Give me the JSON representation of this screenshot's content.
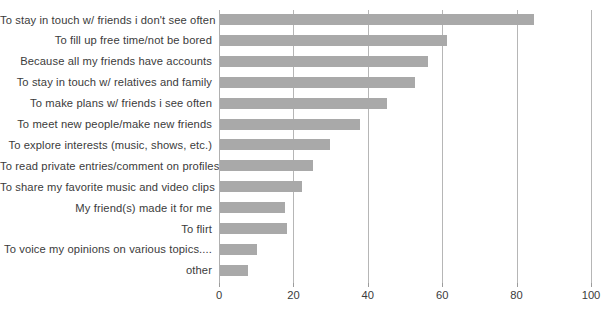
{
  "chart_data": {
    "type": "bar",
    "orientation": "horizontal",
    "title": "",
    "subtitle": "",
    "xlabel": "",
    "ylabel": "",
    "xlim": [
      0,
      100
    ],
    "xticks": [
      0,
      20,
      40,
      60,
      80,
      100
    ],
    "grid": "vertical",
    "legend": "none",
    "bar_color": "#a9a9a9",
    "grid_color": "#b6b6b6",
    "text_color": "#3b3b3b",
    "categories": [
      "To stay in touch w/ friends i don't see often",
      "To fill up free time/not be bored",
      "Because all my friends have accounts",
      "To stay in touch w/ relatives and family",
      "To make plans w/ friends i see often",
      "To meet new people/make new friends",
      "To explore interests (music, shows, etc.)",
      "To read private entries/comment on profiles",
      "To share my favorite music and video clips",
      "My friend(s) made it for me",
      "To flirt",
      "To voice my opinions on various topics....",
      "other"
    ],
    "values": [
      84.5,
      61,
      56,
      52.5,
      45,
      37.5,
      29.5,
      25,
      22,
      17.5,
      18,
      10,
      7.5
    ]
  }
}
